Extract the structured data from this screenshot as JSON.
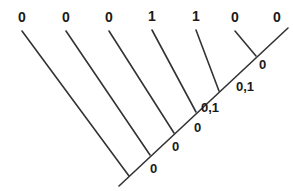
{
  "figure": {
    "name": "character-state-cladogram",
    "type": "phylogenetic-tree-diagram",
    "background_color": "#ffffff",
    "line_color": "#333333",
    "text_color": "#1a1a1a"
  },
  "tip_labels": [
    {
      "text": "0",
      "x": 22,
      "y": 17
    },
    {
      "text": "0",
      "x": 66,
      "y": 17
    },
    {
      "text": "0",
      "x": 109,
      "y": 17
    },
    {
      "text": "1",
      "x": 152,
      "y": 16
    },
    {
      "text": "1",
      "x": 196,
      "y": 16
    },
    {
      "text": "0",
      "x": 235,
      "y": 17
    },
    {
      "text": "0",
      "x": 277,
      "y": 17
    }
  ],
  "node_labels": [
    {
      "text": "0",
      "x": 259,
      "y": 64
    },
    {
      "text": "0,1",
      "x": 236,
      "y": 86
    },
    {
      "text": "0,1",
      "x": 201,
      "y": 107
    },
    {
      "text": "0",
      "x": 194,
      "y": 127
    },
    {
      "text": "0",
      "x": 172,
      "y": 146
    },
    {
      "text": "0",
      "x": 150,
      "y": 168
    }
  ],
  "branches": {
    "spine": {
      "x1": 119,
      "y1": 186,
      "x2": 288,
      "y2": 28
    },
    "tips": [
      {
        "x1": 22,
        "y1": 31,
        "x2": 129,
        "y2": 176
      },
      {
        "x1": 66,
        "y1": 31,
        "x2": 150,
        "y2": 155
      },
      {
        "x1": 109,
        "y1": 31,
        "x2": 174,
        "y2": 133
      },
      {
        "x1": 152,
        "y1": 30,
        "x2": 196,
        "y2": 112
      },
      {
        "x1": 196,
        "y1": 30,
        "x2": 219,
        "y2": 91
      },
      {
        "x1": 235,
        "y1": 31,
        "x2": 256,
        "y2": 56
      }
    ]
  }
}
